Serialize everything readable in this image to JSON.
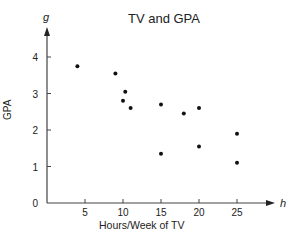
{
  "chart_data": {
    "type": "scatter",
    "title": "TV and GPA",
    "xlabel": "Hours/Week of TV",
    "ylabel": "GPA",
    "x_axis_variable": "h",
    "y_axis_variable": "g",
    "xlim": [
      0,
      28
    ],
    "ylim": [
      0,
      4.5
    ],
    "xticks": [
      5,
      10,
      15,
      20,
      25
    ],
    "yticks": [
      0,
      1,
      2,
      3,
      4
    ],
    "grid": false,
    "legend": null,
    "points": [
      {
        "x": 4,
        "y": 3.75
      },
      {
        "x": 9,
        "y": 3.55
      },
      {
        "x": 10.3,
        "y": 3.05
      },
      {
        "x": 10,
        "y": 2.8
      },
      {
        "x": 11,
        "y": 2.6
      },
      {
        "x": 15,
        "y": 2.7
      },
      {
        "x": 18,
        "y": 2.45
      },
      {
        "x": 20,
        "y": 2.6
      },
      {
        "x": 25,
        "y": 1.9
      },
      {
        "x": 15,
        "y": 1.35
      },
      {
        "x": 20,
        "y": 1.55
      },
      {
        "x": 25,
        "y": 1.1
      }
    ]
  }
}
